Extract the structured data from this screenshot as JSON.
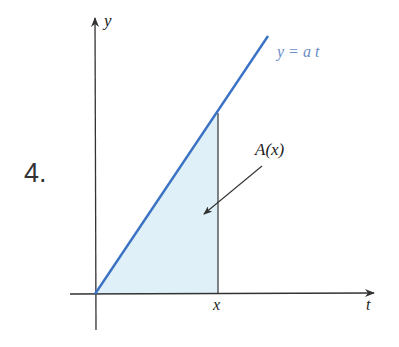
{
  "problem": {
    "number": "4."
  },
  "figure": {
    "axes": {
      "y_label": "y",
      "x_label": "t"
    },
    "curve": {
      "label": "y = a t",
      "color": "#3a72c4"
    },
    "region": {
      "label": "A(x)",
      "fill": "#dff0f8",
      "bound_label": "x"
    },
    "colors": {
      "axis": "#333333",
      "text": "#222222",
      "curve_label": "#6a8cc8"
    }
  }
}
